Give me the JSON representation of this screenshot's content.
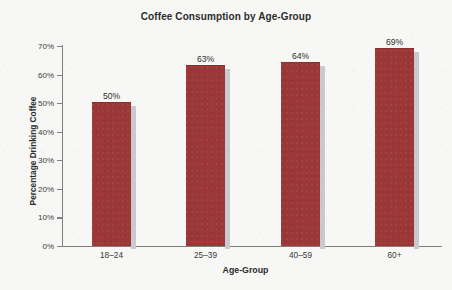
{
  "chart_data": {
    "type": "bar",
    "title": "Coffee Consumption by Age-Group",
    "xlabel": "Age-Group",
    "ylabel": "Percentage Drinking Coffee",
    "categories": [
      "18–24",
      "25–39",
      "40–59",
      "60+"
    ],
    "values": [
      50,
      63,
      64,
      69
    ],
    "value_labels": [
      "50%",
      "63%",
      "64%",
      "69%"
    ],
    "ylim": [
      0,
      70
    ],
    "ytick_values": [
      0,
      10,
      20,
      30,
      40,
      50,
      60,
      70
    ],
    "ytick_labels": [
      "0%",
      "10%",
      "20%",
      "30%",
      "40%",
      "50%",
      "60%",
      "70%"
    ],
    "grid": false,
    "legend": false,
    "legend_position": "none",
    "bar_color": "#9C3737",
    "bar_shadow_color": "#C9C9CF",
    "axis_color": "#808080",
    "plot_background": "#FFFFFF",
    "figure_background": "#F7F7F5",
    "text_color": "#2C2C2C"
  }
}
